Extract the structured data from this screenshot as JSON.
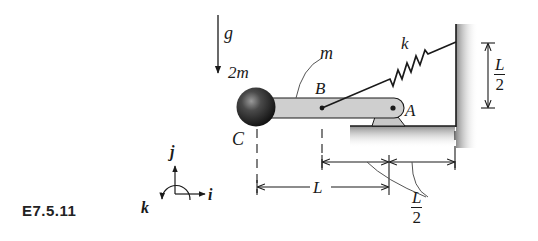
{
  "figure": {
    "caption": "E7.5.11",
    "labels": {
      "gravity": "g",
      "ball_mass": "2m",
      "bar_mass": "m",
      "spring_constant": "k",
      "point_b": "B",
      "point_a": "A",
      "point_c": "C",
      "axis_i": "i",
      "axis_j": "j",
      "axis_k": "k"
    },
    "dimensions": {
      "spring_height": {
        "num": "L",
        "den": "2"
      },
      "c_to_pin": "L",
      "b_to_pin_and_pin_to_wall": {
        "num": "L",
        "den": "2"
      }
    },
    "colors": {
      "ink": "#1a1a1a",
      "bar_fill": "#cfcfcf",
      "ball_dark": "#1e1e1e",
      "ground_shade": "#9a9a9a",
      "leader": "#555555"
    }
  }
}
